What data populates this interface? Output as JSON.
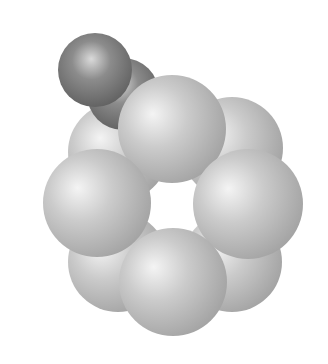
{
  "figure": {
    "background": "#ffffff",
    "colors": {
      "light_highlight": "#f4f4f4",
      "light_mid": "#cbcbcb",
      "light_edge": "#a4a4a4",
      "dark_highlight": "#dadada",
      "dark_mid": "#8c8c8c",
      "dark_edge": "#5e5e5e"
    },
    "atoms": [
      {
        "id": "ring-back-upper-left",
        "cx": 118,
        "cy": 152,
        "r": 50,
        "tone": "light",
        "layer": "back"
      },
      {
        "id": "ring-back-upper-right",
        "cx": 232,
        "cy": 148,
        "r": 51,
        "tone": "light",
        "layer": "back"
      },
      {
        "id": "ring-back-lower-left",
        "cx": 118,
        "cy": 262,
        "r": 50,
        "tone": "light",
        "layer": "back"
      },
      {
        "id": "ring-back-lower-right",
        "cx": 232,
        "cy": 262,
        "r": 50,
        "tone": "light",
        "layer": "back"
      },
      {
        "id": "substituent-inner",
        "cx": 123,
        "cy": 94,
        "r": 36,
        "tone": "dark",
        "layer": "mid"
      },
      {
        "id": "substituent-outer",
        "cx": 95,
        "cy": 70,
        "r": 37,
        "tone": "dark",
        "layer": "front"
      },
      {
        "id": "ring-front-top",
        "cx": 172,
        "cy": 129,
        "r": 54,
        "tone": "light",
        "layer": "front"
      },
      {
        "id": "ring-front-left",
        "cx": 97,
        "cy": 203,
        "r": 54,
        "tone": "light",
        "layer": "front"
      },
      {
        "id": "ring-front-right",
        "cx": 248,
        "cy": 204,
        "r": 55,
        "tone": "light",
        "layer": "front"
      },
      {
        "id": "ring-front-bottom",
        "cx": 173,
        "cy": 282,
        "r": 54,
        "tone": "light",
        "layer": "front"
      }
    ],
    "ring_center": {
      "cx": 172,
      "cy": 205
    }
  }
}
